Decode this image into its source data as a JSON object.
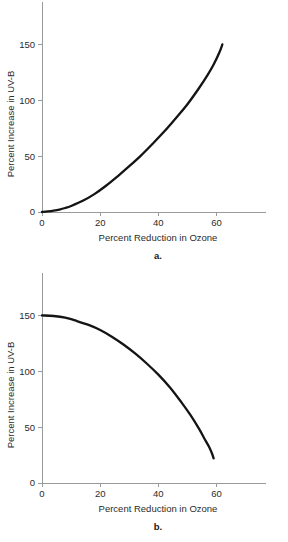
{
  "figure": {
    "background_color": "#ffffff",
    "curve_color": "#141414",
    "axis_color": "#9a9a9a",
    "text_color": "#2b2b2b"
  },
  "panels": [
    {
      "letter": "a.",
      "xlabel": "Percent Reduction in Ozone",
      "ylabel": "Percent Increase in UV-B",
      "xticks": [
        "0",
        "20",
        "40",
        "60"
      ],
      "yticks": [
        "0",
        "50",
        "100",
        "150"
      ]
    },
    {
      "letter": "b.",
      "xlabel": "Percent Reduction in Ozone",
      "ylabel": "Percent Increase in UV-B",
      "xticks": [
        "0",
        "20",
        "40",
        "60"
      ],
      "yticks": [
        "0",
        "50",
        "100",
        "150"
      ]
    }
  ],
  "chart_data": [
    {
      "type": "line",
      "panel": "a.",
      "title": "",
      "xlabel": "Percent Reduction in Ozone",
      "ylabel": "Percent Increase in UV-B",
      "xlim": [
        0,
        77
      ],
      "ylim": [
        0,
        188
      ],
      "xticks": [
        0,
        20,
        40,
        60
      ],
      "yticks": [
        0,
        50,
        100,
        150
      ],
      "grid": false,
      "legend": null,
      "series": [
        {
          "name": "Percent Increase in UV-B",
          "x": [
            0,
            2,
            4,
            6,
            8,
            10,
            14,
            18,
            22,
            26,
            30,
            34,
            38,
            42,
            46,
            50,
            54,
            57,
            59,
            61,
            62
          ],
          "y": [
            0,
            0.5,
            1.2,
            2.2,
            3.6,
            5.4,
            10,
            16,
            23.5,
            32,
            41,
            50.5,
            61,
            72,
            84,
            96.5,
            111,
            123,
            132,
            143,
            150
          ]
        }
      ]
    },
    {
      "type": "line",
      "panel": "b.",
      "title": "",
      "xlabel": "Percent Reduction in Ozone",
      "ylabel": "Percent Increase in UV-B",
      "xlim": [
        0,
        77
      ],
      "ylim": [
        0,
        188
      ],
      "xticks": [
        0,
        20,
        40,
        60
      ],
      "yticks": [
        0,
        50,
        100,
        150
      ],
      "grid": false,
      "legend": null,
      "series": [
        {
          "name": "Percent Increase in UV-B",
          "x": [
            0,
            4,
            8,
            12,
            16,
            20,
            24,
            28,
            32,
            36,
            40,
            44,
            48,
            51,
            54,
            56,
            57.5,
            58.5,
            59
          ],
          "y": [
            150,
            149.5,
            148,
            145,
            141.5,
            137,
            131,
            124,
            116,
            107,
            97,
            85.5,
            72,
            61,
            48.5,
            39,
            32,
            26,
            22
          ]
        }
      ]
    }
  ]
}
